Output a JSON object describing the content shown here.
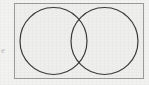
{
  "figure": {
    "kind": "venn-diagram",
    "label": "Two-set Venn diagram inside a rectangular universal-set box",
    "canvas": {
      "width": 149,
      "height": 85,
      "background_color": "#f2f2f0"
    },
    "margin_text": "e",
    "box": {
      "name": "universal-set-rectangle",
      "x": 14.5,
      "y": 3.5,
      "width": 129,
      "height": 75,
      "fill_color": "#eeeeec",
      "stroke_color": "#9a9a98",
      "stroke_width": 1
    },
    "circles": [
      {
        "name": "left-set-circle",
        "label": "",
        "cx": 53.5,
        "cy": 41,
        "r": 33.5,
        "stroke_color": "#3a3a3a",
        "stroke_width": 1.2,
        "fill": "none"
      },
      {
        "name": "right-set-circle",
        "label": "",
        "cx": 104.5,
        "cy": 41,
        "r": 33.5,
        "stroke_color": "#3a3a3a",
        "stroke_width": 1.2,
        "fill": "none"
      }
    ],
    "regions": {
      "intersection_shaded": false,
      "left_only_shaded": false,
      "right_only_shaded": false,
      "outside_shaded": false
    }
  }
}
